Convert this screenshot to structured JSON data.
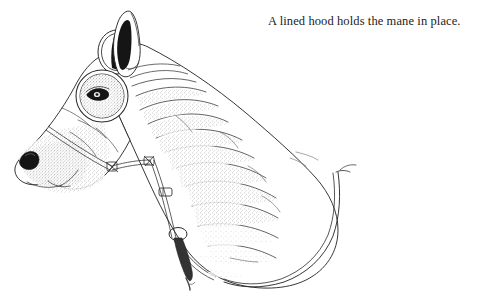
{
  "page": {
    "background_color": "#ffffff",
    "width": 483,
    "height": 300,
    "ink_color": "#2b2b2b",
    "shade_color": "#6f6f6f",
    "dark_fill_color": "#151515"
  },
  "caption": {
    "text": "A lined hood holds the mane in place.",
    "color": "#1c1c1c",
    "align": "right"
  },
  "illustration": {
    "title": "Horse head wearing a lined hood",
    "medium": "pen-and-ink line drawing with stipple shading",
    "subject": "horse in profile facing left",
    "parts": [
      {
        "name": "ear-opening",
        "label": "Hood ear opening with ear showing through"
      },
      {
        "name": "ear",
        "label": "Pointed ear with dark inner shading"
      },
      {
        "name": "eye-opening",
        "label": "Circular hood eye opening"
      },
      {
        "name": "eye",
        "label": "Dark horse eye with stippled surround"
      },
      {
        "name": "muzzle",
        "label": "Muzzle with stippled shading"
      },
      {
        "name": "nostril",
        "label": "Dark nostril"
      },
      {
        "name": "halter-noseband",
        "label": "Halter noseband strap"
      },
      {
        "name": "halter-cheek-strap",
        "label": "Halter cheek strap"
      },
      {
        "name": "halter-buckle-upper",
        "label": "Upper halter buckle"
      },
      {
        "name": "halter-buckle-lower",
        "label": "Lower halter buckle"
      },
      {
        "name": "halter-ring",
        "label": "Halter ring with hanging lead clip"
      },
      {
        "name": "hood-body",
        "label": "Hood body covering neck and mane"
      },
      {
        "name": "hood-wrinkles",
        "label": "Fabric fold and wrinkle lines"
      },
      {
        "name": "hood-hem",
        "label": "Double-stitched hood hem along shoulder"
      }
    ]
  }
}
